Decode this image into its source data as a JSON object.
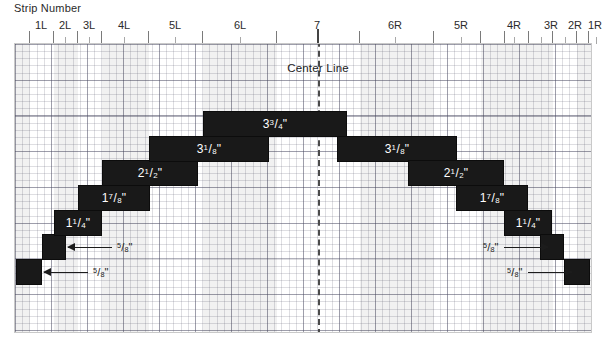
{
  "header": {
    "caption": "Strip Number"
  },
  "ruler": {
    "labels": [
      {
        "text": "1L",
        "x": 27
      },
      {
        "text": "2L",
        "x": 51
      },
      {
        "text": "3L",
        "x": 75
      },
      {
        "text": "4L",
        "x": 110
      },
      {
        "text": "5L",
        "x": 161
      },
      {
        "text": "6L",
        "x": 226
      },
      {
        "text": "7",
        "x": 303
      },
      {
        "text": "6R",
        "x": 381
      },
      {
        "text": "5R",
        "x": 447
      },
      {
        "text": "4R",
        "x": 500
      },
      {
        "text": "3R",
        "x": 537
      },
      {
        "text": "2R",
        "x": 561
      },
      {
        "text": "1R",
        "x": 581
      }
    ],
    "major_ticks": [
      15,
      39,
      63,
      87,
      134,
      188,
      262,
      303,
      345,
      419,
      466,
      490,
      514,
      538,
      562,
      574,
      590
    ],
    "minor_ticks": [
      51,
      75,
      110,
      161,
      226,
      381,
      447,
      500,
      527,
      551,
      582
    ]
  },
  "plot": {
    "center_label": "Center Line",
    "bands": [
      {
        "x": 0,
        "w": 15
      },
      {
        "x": 39,
        "w": 24
      },
      {
        "x": 87,
        "w": 47
      },
      {
        "x": 188,
        "w": 74
      },
      {
        "x": 345,
        "w": 74
      },
      {
        "x": 466,
        "w": 48
      },
      {
        "x": 514,
        "w": 24
      },
      {
        "x": 562,
        "w": 14
      }
    ]
  },
  "chart_data": {
    "type": "bar",
    "xlabel": "Strip Number",
    "ylabel": "",
    "grid": true,
    "categories": [
      "1L",
      "2L",
      "3L",
      "4L",
      "5L",
      "6L",
      "7",
      "6R",
      "5R",
      "4R",
      "3R",
      "2R",
      "1R"
    ],
    "values": [
      0.625,
      0.625,
      1.25,
      1.875,
      2.5,
      3.125,
      3.75,
      3.125,
      2.5,
      1.875,
      1.25,
      0.625,
      0.625
    ],
    "value_labels": [
      "5/8\"",
      "5/8\"",
      "1 1/4\"",
      "1 7/8\"",
      "2 1/2\"",
      "3 1/8\"",
      "3 3/4\"",
      "3 1/8\"",
      "2 1/2\"",
      "1 7/8\"",
      "1 1/4\"",
      "5/8\"",
      "5/8\""
    ],
    "units": "inches"
  },
  "blocks": [
    {
      "name": "block-1l",
      "x": 1,
      "y": 215,
      "w": 26,
      "h": 26,
      "label": "",
      "whole": "",
      "num": "",
      "den": "",
      "has_label": false
    },
    {
      "name": "block-2l",
      "x": 27,
      "y": 190,
      "w": 24,
      "h": 26,
      "label": "",
      "whole": "",
      "num": "",
      "den": "",
      "has_label": false
    },
    {
      "name": "block-3l",
      "x": 39,
      "y": 166,
      "w": 48,
      "h": 26,
      "label": "1 1/4\"",
      "whole": "1",
      "num": "1",
      "den": "4",
      "has_label": true
    },
    {
      "name": "block-4l",
      "x": 63,
      "y": 141,
      "w": 72,
      "h": 26,
      "label": "1 7/8\"",
      "whole": "1",
      "num": "7",
      "den": "8",
      "has_label": true
    },
    {
      "name": "block-5l",
      "x": 87,
      "y": 116,
      "w": 96,
      "h": 26,
      "label": "2 1/2\"",
      "whole": "2",
      "num": "1",
      "den": "2",
      "has_label": true
    },
    {
      "name": "block-6l",
      "x": 134,
      "y": 92,
      "w": 120,
      "h": 26,
      "label": "3 1/8\"",
      "whole": "3",
      "num": "1",
      "den": "8",
      "has_label": true
    },
    {
      "name": "block-7",
      "x": 188,
      "y": 67,
      "w": 144,
      "h": 26,
      "label": "3 3/4\"",
      "whole": "3",
      "num": "3",
      "den": "4",
      "has_label": true
    },
    {
      "name": "block-6r",
      "x": 322,
      "y": 92,
      "w": 120,
      "h": 26,
      "label": "3 1/8\"",
      "whole": "3",
      "num": "1",
      "den": "8",
      "has_label": true
    },
    {
      "name": "block-5r",
      "x": 393,
      "y": 116,
      "w": 96,
      "h": 26,
      "label": "2 1/2\"",
      "whole": "2",
      "num": "1",
      "den": "2",
      "has_label": true
    },
    {
      "name": "block-4r",
      "x": 441,
      "y": 141,
      "w": 72,
      "h": 26,
      "label": "1 7/8\"",
      "whole": "1",
      "num": "7",
      "den": "8",
      "has_label": true
    },
    {
      "name": "block-3r",
      "x": 489,
      "y": 166,
      "w": 48,
      "h": 26,
      "label": "1 1/4\"",
      "whole": "1",
      "num": "1",
      "den": "4",
      "has_label": true
    },
    {
      "name": "block-2r",
      "x": 525,
      "y": 190,
      "w": 24,
      "h": 26,
      "label": "",
      "whole": "",
      "num": "",
      "den": "",
      "has_label": false
    },
    {
      "name": "block-1r",
      "x": 549,
      "y": 215,
      "w": 26,
      "h": 26,
      "label": "",
      "whole": "",
      "num": "",
      "den": "",
      "has_label": false
    }
  ],
  "callouts": [
    {
      "name": "callout-2l",
      "side": "left",
      "x": 53,
      "y": 196,
      "line": 44,
      "whole": "",
      "num": "5",
      "den": "8"
    },
    {
      "name": "callout-1l",
      "side": "left",
      "x": 29,
      "y": 221,
      "line": 44,
      "whole": "",
      "num": "5",
      "den": "8"
    },
    {
      "name": "callout-2r",
      "side": "right",
      "x": 463,
      "y": 196,
      "line": 44,
      "whole": "",
      "num": "5",
      "den": "8"
    },
    {
      "name": "callout-1r",
      "side": "right",
      "x": 487,
      "y": 221,
      "line": 44,
      "whole": "",
      "num": "5",
      "den": "8"
    }
  ],
  "geometry": {
    "center_x": 303,
    "center_label_x": 303,
    "center_label_y": 18
  }
}
